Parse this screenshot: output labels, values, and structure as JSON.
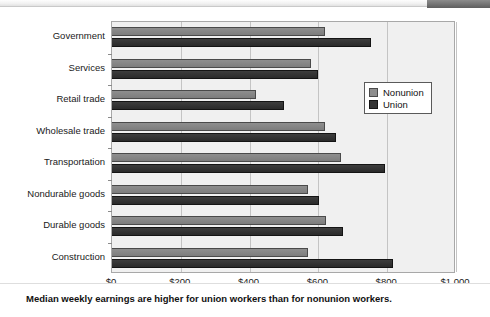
{
  "header": {
    "strip_label": "",
    "badge_label": ""
  },
  "chart_data": {
    "type": "bar",
    "orientation": "horizontal",
    "title": "",
    "xlabel": "",
    "ylabel": "",
    "xlim": [
      0,
      1000
    ],
    "grid": true,
    "legend_position": "right",
    "categories": [
      "Government",
      "Services",
      "Retail trade",
      "Wholesale trade",
      "Transportation",
      "Nondurable goods",
      "Durable goods",
      "Construction"
    ],
    "tick_labels": [
      "$0",
      "$200",
      "$400",
      "$600",
      "$800",
      "$1,000"
    ],
    "tick_values": [
      0,
      200,
      400,
      600,
      800,
      1000
    ],
    "series": [
      {
        "name": "Nonunion",
        "color": "#8e8e8e",
        "values": [
          620,
          578,
          420,
          620,
          665,
          570,
          622,
          570
        ]
      },
      {
        "name": "Union",
        "color": "#333333",
        "values": [
          753,
          598,
          500,
          650,
          795,
          602,
          672,
          816
        ]
      }
    ]
  },
  "caption": {
    "text": "Median weekly earnings are higher for union workers than for nonunion workers."
  }
}
